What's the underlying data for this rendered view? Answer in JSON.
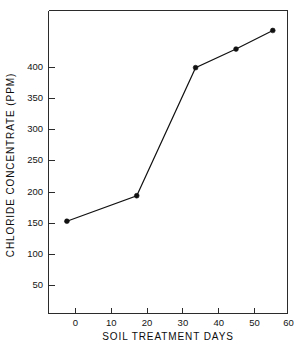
{
  "chart_data": {
    "type": "line",
    "title": "",
    "subtitle": "",
    "xlabel": "SOIL TREATMENT DAYS",
    "ylabel": "CHLORIDE CONCENTRATE (PPM)",
    "xlim": [
      -5,
      60
    ],
    "ylim": [
      0,
      440
    ],
    "xticks": [
      0,
      10,
      20,
      30,
      40,
      50,
      60
    ],
    "xtick_labels": [
      "0",
      "10",
      "20",
      "30",
      "40",
      "50",
      "60"
    ],
    "yticks": [
      50,
      100,
      150,
      200,
      250,
      300,
      350,
      400
    ],
    "ytick_labels": [
      "50",
      "100",
      "150",
      "200",
      "250",
      "300",
      "350",
      "400"
    ],
    "grid": false,
    "legend": false,
    "legend_position": "none",
    "marker": "filled-circle",
    "line_color": "#111111",
    "marker_color": "#111111",
    "x": [
      0,
      19,
      35,
      46,
      56
    ],
    "series": [
      {
        "name": "Chloride concentrate",
        "values": [
          134,
          171,
          357,
          384,
          411
        ]
      }
    ],
    "points": [
      {
        "x": 0,
        "y": 134
      },
      {
        "x": 19,
        "y": 171
      },
      {
        "x": 35,
        "y": 357
      },
      {
        "x": 46,
        "y": 384
      },
      {
        "x": 56,
        "y": 411
      }
    ]
  }
}
